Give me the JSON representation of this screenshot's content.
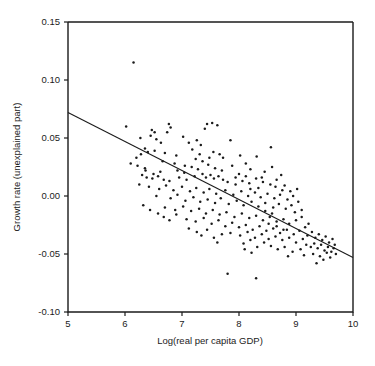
{
  "chart_data": {
    "type": "scatter",
    "title": "",
    "xlabel": "Log(real per capita GDP)",
    "ylabel": "Growth rate (unexplained part)",
    "xlim": [
      5,
      10
    ],
    "ylim": [
      -0.1,
      0.15
    ],
    "xticks": [
      5,
      6,
      7,
      8,
      9,
      10
    ],
    "xtick_labels": [
      "5",
      "6",
      "7",
      "8",
      "9",
      "10"
    ],
    "yticks": [
      -0.1,
      -0.05,
      0.0,
      0.05,
      0.1,
      0.15
    ],
    "ytick_labels": [
      "-0.10",
      "-0.05",
      "0.00",
      "0.05",
      "0.10",
      "0.15"
    ],
    "grid": false,
    "legend": null,
    "marker_color": "#1b1b1b",
    "line_color": "#1b1b1b",
    "frame_color": "#1b1b1b",
    "fit_line": {
      "label": "regression line",
      "x": [
        5,
        10
      ],
      "y": [
        0.072,
        -0.053
      ],
      "slope": -0.025,
      "intercept": 0.197
    },
    "points": [
      [
        6.15,
        0.115
      ],
      [
        6.02,
        0.06
      ],
      [
        6.47,
        0.057
      ],
      [
        6.52,
        0.055
      ],
      [
        6.77,
        0.062
      ],
      [
        6.8,
        0.059
      ],
      [
        7.44,
        0.062
      ],
      [
        7.53,
        0.063
      ],
      [
        7.62,
        0.061
      ],
      [
        7.4,
        0.058
      ],
      [
        6.74,
        0.055
      ],
      [
        6.27,
        0.05
      ],
      [
        6.45,
        0.052
      ],
      [
        6.55,
        0.049
      ],
      [
        6.63,
        0.046
      ],
      [
        7.02,
        0.051
      ],
      [
        7.12,
        0.046
      ],
      [
        7.26,
        0.048
      ],
      [
        7.33,
        0.044
      ],
      [
        7.85,
        0.048
      ],
      [
        8.56,
        0.042
      ],
      [
        6.35,
        0.041
      ],
      [
        6.4,
        0.038
      ],
      [
        6.52,
        0.039
      ],
      [
        6.7,
        0.037
      ],
      [
        6.9,
        0.035
      ],
      [
        7.18,
        0.04
      ],
      [
        7.31,
        0.036
      ],
      [
        7.55,
        0.038
      ],
      [
        8.02,
        0.035
      ],
      [
        8.31,
        0.034
      ],
      [
        6.1,
        0.028
      ],
      [
        6.22,
        0.026
      ],
      [
        6.35,
        0.024
      ],
      [
        6.66,
        0.03
      ],
      [
        6.87,
        0.028
      ],
      [
        7.05,
        0.026
      ],
      [
        7.17,
        0.025
      ],
      [
        7.28,
        0.023
      ],
      [
        7.46,
        0.027
      ],
      [
        7.58,
        0.024
      ],
      [
        7.7,
        0.022
      ],
      [
        7.88,
        0.026
      ],
      [
        8.12,
        0.028
      ],
      [
        8.2,
        0.023
      ],
      [
        8.45,
        0.021
      ],
      [
        8.58,
        0.025
      ],
      [
        8.74,
        0.018
      ],
      [
        6.3,
        0.018
      ],
      [
        6.38,
        0.016
      ],
      [
        6.48,
        0.015
      ],
      [
        6.58,
        0.017
      ],
      [
        6.68,
        0.014
      ],
      [
        6.78,
        0.013
      ],
      [
        6.95,
        0.016
      ],
      [
        7.08,
        0.014
      ],
      [
        7.22,
        0.017
      ],
      [
        7.36,
        0.019
      ],
      [
        7.42,
        0.016
      ],
      [
        7.5,
        0.018
      ],
      [
        7.56,
        0.015
      ],
      [
        7.64,
        0.017
      ],
      [
        7.72,
        0.014
      ],
      [
        7.8,
        0.012
      ],
      [
        7.94,
        0.016
      ],
      [
        8.06,
        0.013
      ],
      [
        8.18,
        0.011
      ],
      [
        8.3,
        0.015
      ],
      [
        8.42,
        0.012
      ],
      [
        8.55,
        0.01
      ],
      [
        8.66,
        0.014
      ],
      [
        8.8,
        0.009
      ],
      [
        6.25,
        0.01
      ],
      [
        6.42,
        0.008
      ],
      [
        6.6,
        0.006
      ],
      [
        6.72,
        0.009
      ],
      [
        6.85,
        0.005
      ],
      [
        7.0,
        0.008
      ],
      [
        7.14,
        0.004
      ],
      [
        7.25,
        0.007
      ],
      [
        7.38,
        0.003
      ],
      [
        7.48,
        0.006
      ],
      [
        7.6,
        0.002
      ],
      [
        7.76,
        0.005
      ],
      [
        7.9,
        0.001
      ],
      [
        8.04,
        0.004
      ],
      [
        8.16,
        0.0
      ],
      [
        8.28,
        0.003
      ],
      [
        8.38,
        -0.001
      ],
      [
        8.5,
        0.002
      ],
      [
        8.62,
        -0.002
      ],
      [
        8.72,
        0.001
      ],
      [
        8.85,
        -0.003
      ],
      [
        8.95,
        0.0
      ],
      [
        6.55,
        0.0
      ],
      [
        6.8,
        -0.002
      ],
      [
        6.92,
        0.001
      ],
      [
        7.06,
        -0.004
      ],
      [
        7.2,
        -0.001
      ],
      [
        7.32,
        -0.005
      ],
      [
        7.45,
        -0.003
      ],
      [
        7.58,
        -0.006
      ],
      [
        7.68,
        -0.002
      ],
      [
        7.82,
        -0.007
      ],
      [
        7.96,
        -0.004
      ],
      [
        8.08,
        -0.008
      ],
      [
        8.22,
        -0.005
      ],
      [
        8.34,
        -0.009
      ],
      [
        8.46,
        -0.006
      ],
      [
        8.6,
        -0.01
      ],
      [
        8.7,
        -0.007
      ],
      [
        8.82,
        -0.011
      ],
      [
        8.92,
        -0.008
      ],
      [
        9.04,
        -0.005
      ],
      [
        6.7,
        -0.01
      ],
      [
        6.88,
        -0.012
      ],
      [
        7.02,
        -0.009
      ],
      [
        7.16,
        -0.013
      ],
      [
        7.3,
        -0.011
      ],
      [
        7.42,
        -0.015
      ],
      [
        7.54,
        -0.012
      ],
      [
        7.66,
        -0.016
      ],
      [
        7.78,
        -0.014
      ],
      [
        7.92,
        -0.018
      ],
      [
        8.05,
        -0.015
      ],
      [
        8.18,
        -0.019
      ],
      [
        8.3,
        -0.017
      ],
      [
        8.42,
        -0.021
      ],
      [
        8.54,
        -0.018
      ],
      [
        8.66,
        -0.022
      ],
      [
        8.78,
        -0.02
      ],
      [
        8.88,
        -0.024
      ],
      [
        9.0,
        -0.021
      ],
      [
        9.1,
        -0.018
      ],
      [
        7.08,
        -0.02
      ],
      [
        7.24,
        -0.022
      ],
      [
        7.38,
        -0.019
      ],
      [
        7.52,
        -0.024
      ],
      [
        7.64,
        -0.021
      ],
      [
        7.76,
        -0.026
      ],
      [
        7.88,
        -0.023
      ],
      [
        8.0,
        -0.027
      ],
      [
        8.12,
        -0.025
      ],
      [
        8.24,
        -0.029
      ],
      [
        8.36,
        -0.026
      ],
      [
        8.48,
        -0.03
      ],
      [
        8.6,
        -0.028
      ],
      [
        8.72,
        -0.032
      ],
      [
        8.84,
        -0.029
      ],
      [
        8.96,
        -0.033
      ],
      [
        9.06,
        -0.03
      ],
      [
        9.16,
        -0.027
      ],
      [
        9.22,
        -0.024
      ],
      [
        7.85,
        -0.032
      ],
      [
        8.02,
        -0.034
      ],
      [
        8.15,
        -0.031
      ],
      [
        8.28,
        -0.036
      ],
      [
        8.4,
        -0.033
      ],
      [
        8.52,
        -0.037
      ],
      [
        8.64,
        -0.035
      ],
      [
        8.76,
        -0.038
      ],
      [
        8.88,
        -0.036
      ],
      [
        9.0,
        -0.04
      ],
      [
        9.12,
        -0.037
      ],
      [
        9.2,
        -0.034
      ],
      [
        9.28,
        -0.031
      ],
      [
        9.34,
        -0.036
      ],
      [
        9.4,
        -0.033
      ],
      [
        9.46,
        -0.038
      ],
      [
        9.52,
        -0.035
      ],
      [
        9.58,
        -0.04
      ],
      [
        9.64,
        -0.037
      ],
      [
        9.68,
        -0.042
      ],
      [
        9.18,
        -0.042
      ],
      [
        9.26,
        -0.044
      ],
      [
        9.32,
        -0.041
      ],
      [
        9.38,
        -0.045
      ],
      [
        9.44,
        -0.042
      ],
      [
        9.5,
        -0.047
      ],
      [
        9.56,
        -0.044
      ],
      [
        9.62,
        -0.048
      ],
      [
        9.66,
        -0.045
      ],
      [
        9.7,
        -0.05
      ],
      [
        9.3,
        -0.05
      ],
      [
        9.42,
        -0.052
      ],
      [
        9.54,
        -0.049
      ],
      [
        9.6,
        -0.053
      ],
      [
        9.48,
        -0.055
      ],
      [
        9.36,
        -0.058
      ],
      [
        8.94,
        -0.048
      ],
      [
        8.86,
        -0.052
      ],
      [
        9.08,
        -0.046
      ],
      [
        6.68,
        -0.018
      ],
      [
        6.78,
        -0.021
      ],
      [
        6.9,
        -0.016
      ],
      [
        6.58,
        -0.015
      ],
      [
        6.44,
        -0.012
      ],
      [
        6.32,
        -0.008
      ],
      [
        7.12,
        -0.028
      ],
      [
        7.26,
        -0.031
      ],
      [
        7.44,
        -0.029
      ],
      [
        7.34,
        -0.034
      ],
      [
        7.56,
        -0.036
      ],
      [
        7.7,
        -0.033
      ],
      [
        7.62,
        -0.04
      ],
      [
        8.08,
        -0.041
      ],
      [
        8.2,
        -0.038
      ],
      [
        8.32,
        -0.044
      ],
      [
        8.44,
        -0.04
      ],
      [
        8.1,
        -0.046
      ],
      [
        8.22,
        -0.049
      ],
      [
        8.56,
        -0.043
      ],
      [
        8.68,
        -0.046
      ],
      [
        8.8,
        -0.044
      ],
      [
        7.8,
        -0.067
      ],
      [
        8.3,
        -0.071
      ],
      [
        6.92,
        0.022
      ],
      [
        7.04,
        0.02
      ],
      [
        6.62,
        0.021
      ],
      [
        6.5,
        0.019
      ],
      [
        6.36,
        0.022
      ],
      [
        6.2,
        0.033
      ],
      [
        6.28,
        0.036
      ],
      [
        7.48,
        0.033
      ],
      [
        7.36,
        0.03
      ],
      [
        7.24,
        0.032
      ],
      [
        8.64,
        0.008
      ],
      [
        8.76,
        0.005
      ],
      [
        8.9,
        0.004
      ],
      [
        9.02,
        0.006
      ],
      [
        8.98,
        -0.014
      ],
      [
        9.1,
        -0.012
      ],
      [
        8.2,
        0.006
      ],
      [
        8.34,
        0.007
      ],
      [
        8.46,
        -0.013
      ],
      [
        8.58,
        -0.015
      ],
      [
        7.94,
        0.01
      ],
      [
        8.0,
        0.019
      ],
      [
        8.12,
        0.017
      ],
      [
        7.72,
        0.033
      ],
      [
        7.66,
        0.036
      ],
      [
        8.4,
        0.016
      ],
      [
        8.52,
        -0.024
      ],
      [
        8.66,
        -0.026
      ],
      [
        8.78,
        -0.029
      ],
      [
        9.14,
        -0.051
      ]
    ]
  }
}
